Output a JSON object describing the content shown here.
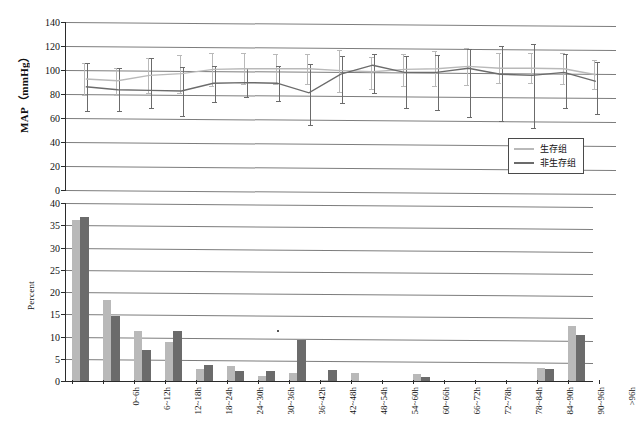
{
  "figure": {
    "background": "#ffffff",
    "series_colors": {
      "survivor": "#b9b9b9",
      "nonsurvivor": "#6b6b6b"
    },
    "grid_color": "#7d7d7d",
    "axis_color": "#2b2b2b"
  },
  "legend": {
    "position": "top-right-inside",
    "entries": [
      {
        "label": "生存组",
        "color": "#b9b9b9"
      },
      {
        "label": "非生存组",
        "color": "#6b6b6b"
      }
    ]
  },
  "categories": [
    "0~6h",
    "6~12h",
    "12~18h",
    "18~24h",
    "24~30h",
    "30~36h",
    "36~42h",
    "42~48h",
    "48~54h",
    "54~60h",
    "60~66h",
    "66~72h",
    "72~78h",
    "78~84h",
    "84~90h",
    "90~96h",
    ">96h"
  ],
  "chart_data": [
    {
      "id": "map-line-chart",
      "type": "line",
      "title": "",
      "xlabel": "",
      "ylabel": "MAP（mmHg）",
      "ylim": [
        0,
        140
      ],
      "yticks": [
        0,
        20,
        40,
        60,
        80,
        100,
        120,
        140
      ],
      "grid": true,
      "legend_position": "inside-bottom-right",
      "x": [
        "0~6h",
        "6~12h",
        "12~18h",
        "18~24h",
        "24~30h",
        "30~36h",
        "36~42h",
        "42~48h",
        "48~54h",
        "54~60h",
        "60~66h",
        "66~72h",
        "72~78h",
        "78~84h",
        "84~90h",
        "90~96h",
        ">96h"
      ],
      "series": [
        {
          "name": "生存组",
          "color": "#b9b9b9",
          "values": [
            92.5,
            91.0,
            95.5,
            97.0,
            100.5,
            101.0,
            101.0,
            101.0,
            99.5,
            98.5,
            100.5,
            101.0,
            103.0,
            101.5,
            101.5,
            101.0,
            96.0
          ],
          "err_low": [
            79.0,
            79.5,
            81.0,
            80.5,
            87.0,
            88.0,
            88.5,
            88.5,
            81.5,
            84.5,
            87.0,
            86.5,
            87.5,
            89.0,
            89.0,
            88.0,
            84.0
          ],
          "err_high": [
            106.0,
            102.0,
            110.0,
            112.5,
            114.0,
            114.0,
            113.5,
            113.0,
            117.0,
            110.5,
            113.5,
            115.5,
            118.5,
            114.0,
            114.0,
            114.5,
            108.0
          ]
        },
        {
          "name": "非生存组",
          "color": "#6b6b6b",
          "values": [
            86.0,
            83.5,
            83.0,
            82.5,
            89.0,
            89.5,
            89.0,
            81.0,
            96.5,
            104.0,
            98.0,
            98.0,
            101.5,
            96.5,
            95.5,
            98.0,
            90.5
          ],
          "err_low": [
            65.5,
            66.0,
            68.5,
            62.0,
            73.5,
            77.5,
            74.0,
            54.5,
            72.5,
            80.5,
            68.5,
            66.5,
            60.5,
            57.5,
            52.0,
            68.5,
            63.5
          ],
          "err_high": [
            105.5,
            101.5,
            110.0,
            102.5,
            103.5,
            101.5,
            103.5,
            105.0,
            112.0,
            113.5,
            112.0,
            112.5,
            117.5,
            120.0,
            121.5,
            113.0,
            107.0
          ]
        }
      ]
    },
    {
      "id": "percent-bar-chart",
      "type": "bar",
      "title": "",
      "xlabel": "",
      "ylabel": "Percent",
      "ylim": [
        0,
        40
      ],
      "yticks": [
        0,
        5,
        10,
        15,
        20,
        25,
        30,
        35,
        40
      ],
      "grid": true,
      "categories": [
        "0~6h",
        "6~12h",
        "12~18h",
        "18~24h",
        "24~30h",
        "30~36h",
        "36~42h",
        "42~48h",
        "48~54h",
        "54~60h",
        "60~66h",
        "66~72h",
        "72~78h",
        "78~84h",
        "84~90h",
        "90~96h",
        ">96h"
      ],
      "series": [
        {
          "name": "生存组",
          "color": "#b9b9b9",
          "values": [
            36.2,
            18.3,
            11.3,
            8.7,
            2.8,
            3.3,
            1.2,
            1.9,
            0.2,
            1.7,
            0.0,
            1.6,
            0.0,
            0.0,
            0.0,
            3.0,
            12.4
          ]
        },
        {
          "name": "非生存组",
          "color": "#6b6b6b",
          "values": [
            36.8,
            14.7,
            6.9,
            11.2,
            3.7,
            2.3,
            2.3,
            9.3,
            2.4,
            0.0,
            0.0,
            1.0,
            0.0,
            0.0,
            0.0,
            2.8,
            10.3
          ]
        }
      ]
    }
  ]
}
